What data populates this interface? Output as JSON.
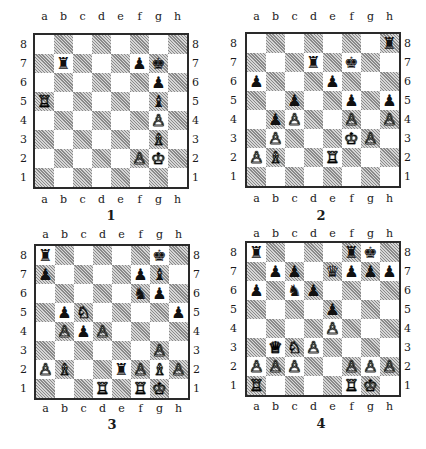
{
  "files": [
    "a",
    "b",
    "c",
    "d",
    "e",
    "f",
    "g",
    "h"
  ],
  "ranks": [
    "8",
    "7",
    "6",
    "5",
    "4",
    "3",
    "2",
    "1"
  ],
  "diagrams": [
    {
      "number": "1",
      "pieces": [
        {
          "sq": "b7",
          "color": "b",
          "type": "R"
        },
        {
          "sq": "f7",
          "color": "b",
          "type": "P"
        },
        {
          "sq": "g7",
          "color": "b",
          "type": "K"
        },
        {
          "sq": "g6",
          "color": "b",
          "type": "P"
        },
        {
          "sq": "g5",
          "color": "b",
          "type": "B"
        },
        {
          "sq": "a5",
          "color": "w",
          "type": "R"
        },
        {
          "sq": "g4",
          "color": "w",
          "type": "P"
        },
        {
          "sq": "g3",
          "color": "w",
          "type": "B"
        },
        {
          "sq": "f2",
          "color": "w",
          "type": "P"
        },
        {
          "sq": "g2",
          "color": "w",
          "type": "K"
        }
      ]
    },
    {
      "number": "2",
      "pieces": [
        {
          "sq": "h8",
          "color": "b",
          "type": "R"
        },
        {
          "sq": "d7",
          "color": "b",
          "type": "R"
        },
        {
          "sq": "f7",
          "color": "b",
          "type": "K"
        },
        {
          "sq": "a6",
          "color": "b",
          "type": "P"
        },
        {
          "sq": "e6",
          "color": "b",
          "type": "P"
        },
        {
          "sq": "c5",
          "color": "b",
          "type": "P"
        },
        {
          "sq": "f5",
          "color": "b",
          "type": "P"
        },
        {
          "sq": "h5",
          "color": "b",
          "type": "P"
        },
        {
          "sq": "b4",
          "color": "b",
          "type": "P"
        },
        {
          "sq": "c4",
          "color": "w",
          "type": "P"
        },
        {
          "sq": "f4",
          "color": "w",
          "type": "P"
        },
        {
          "sq": "h4",
          "color": "w",
          "type": "P"
        },
        {
          "sq": "b3",
          "color": "w",
          "type": "P"
        },
        {
          "sq": "f3",
          "color": "w",
          "type": "K"
        },
        {
          "sq": "g3",
          "color": "w",
          "type": "P"
        },
        {
          "sq": "a2",
          "color": "w",
          "type": "P"
        },
        {
          "sq": "b2",
          "color": "w",
          "type": "B"
        },
        {
          "sq": "e2",
          "color": "w",
          "type": "R"
        }
      ]
    },
    {
      "number": "3",
      "pieces": [
        {
          "sq": "a8",
          "color": "b",
          "type": "R"
        },
        {
          "sq": "g8",
          "color": "b",
          "type": "K"
        },
        {
          "sq": "a7",
          "color": "b",
          "type": "P"
        },
        {
          "sq": "f7",
          "color": "b",
          "type": "P"
        },
        {
          "sq": "g7",
          "color": "b",
          "type": "B"
        },
        {
          "sq": "f6",
          "color": "b",
          "type": "N"
        },
        {
          "sq": "g6",
          "color": "b",
          "type": "P"
        },
        {
          "sq": "b5",
          "color": "b",
          "type": "P"
        },
        {
          "sq": "h5",
          "color": "b",
          "type": "P"
        },
        {
          "sq": "c4",
          "color": "b",
          "type": "P"
        },
        {
          "sq": "e2",
          "color": "b",
          "type": "R"
        },
        {
          "sq": "c5",
          "color": "w",
          "type": "N"
        },
        {
          "sq": "b4",
          "color": "w",
          "type": "P"
        },
        {
          "sq": "d4",
          "color": "w",
          "type": "P"
        },
        {
          "sq": "g3",
          "color": "w",
          "type": "P"
        },
        {
          "sq": "a2",
          "color": "w",
          "type": "P"
        },
        {
          "sq": "b2",
          "color": "w",
          "type": "B"
        },
        {
          "sq": "f2",
          "color": "w",
          "type": "P"
        },
        {
          "sq": "g2",
          "color": "w",
          "type": "B"
        },
        {
          "sq": "h2",
          "color": "w",
          "type": "P"
        },
        {
          "sq": "d1",
          "color": "w",
          "type": "R"
        },
        {
          "sq": "f1",
          "color": "w",
          "type": "R"
        },
        {
          "sq": "g1",
          "color": "w",
          "type": "K"
        }
      ]
    },
    {
      "number": "4",
      "pieces": [
        {
          "sq": "a8",
          "color": "b",
          "type": "R"
        },
        {
          "sq": "f8",
          "color": "b",
          "type": "R"
        },
        {
          "sq": "g8",
          "color": "b",
          "type": "K"
        },
        {
          "sq": "b7",
          "color": "b",
          "type": "P"
        },
        {
          "sq": "c7",
          "color": "b",
          "type": "P"
        },
        {
          "sq": "e7",
          "color": "b",
          "type": "Q"
        },
        {
          "sq": "f7",
          "color": "b",
          "type": "P"
        },
        {
          "sq": "g7",
          "color": "b",
          "type": "P"
        },
        {
          "sq": "h7",
          "color": "b",
          "type": "P"
        },
        {
          "sq": "a6",
          "color": "b",
          "type": "P"
        },
        {
          "sq": "c6",
          "color": "b",
          "type": "N"
        },
        {
          "sq": "d6",
          "color": "b",
          "type": "P"
        },
        {
          "sq": "e5",
          "color": "b",
          "type": "P"
        },
        {
          "sq": "e4",
          "color": "w",
          "type": "P"
        },
        {
          "sq": "b3",
          "color": "w",
          "type": "Q"
        },
        {
          "sq": "c3",
          "color": "w",
          "type": "N"
        },
        {
          "sq": "d3",
          "color": "w",
          "type": "P"
        },
        {
          "sq": "a2",
          "color": "w",
          "type": "P"
        },
        {
          "sq": "b2",
          "color": "w",
          "type": "P"
        },
        {
          "sq": "c2",
          "color": "w",
          "type": "P"
        },
        {
          "sq": "f2",
          "color": "w",
          "type": "P"
        },
        {
          "sq": "g2",
          "color": "w",
          "type": "P"
        },
        {
          "sq": "h2",
          "color": "w",
          "type": "P"
        },
        {
          "sq": "a1",
          "color": "w",
          "type": "R"
        },
        {
          "sq": "f1",
          "color": "w",
          "type": "R"
        },
        {
          "sq": "g1",
          "color": "w",
          "type": "K"
        }
      ]
    }
  ],
  "glyphs": {
    "w": {
      "K": "♔",
      "Q": "♕",
      "R": "♖",
      "B": "♗",
      "N": "♘",
      "P": "♙"
    },
    "b": {
      "K": "♚",
      "Q": "♛",
      "R": "♜",
      "B": "♝",
      "N": "♞",
      "P": "♟"
    }
  },
  "colors": {
    "light_square": "#ffffff",
    "dark_square": "#b0b0b0",
    "border": "#2a2a2a"
  }
}
